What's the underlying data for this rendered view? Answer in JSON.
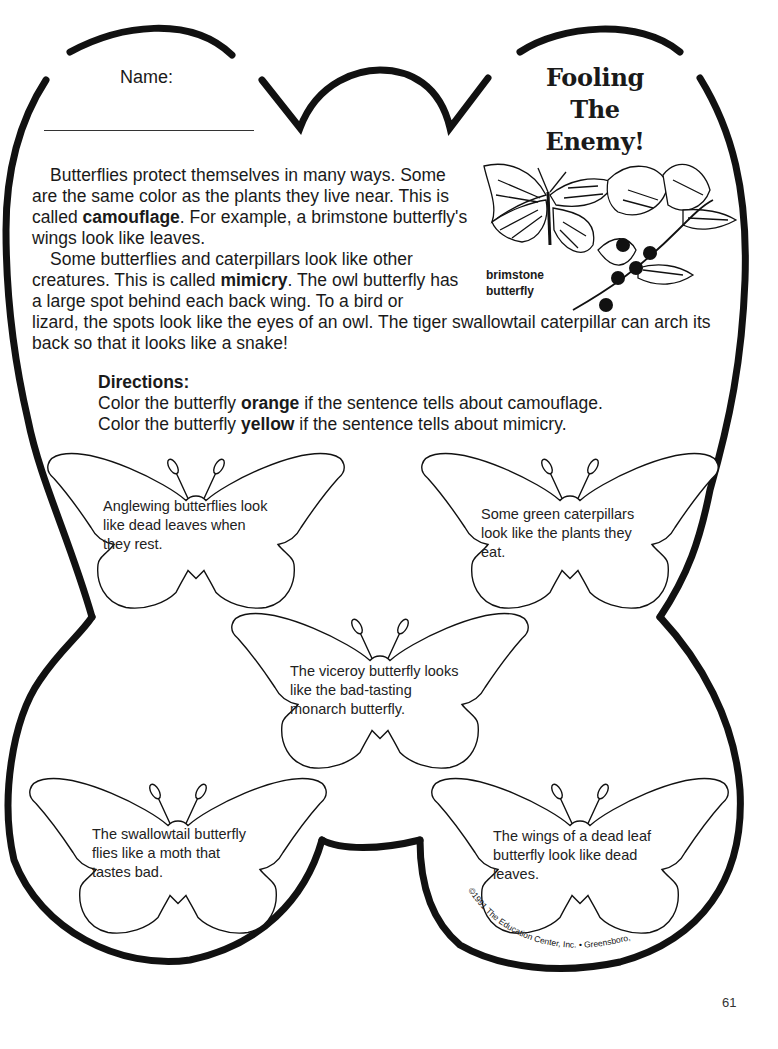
{
  "worksheet": {
    "name_label": "Name:",
    "title_lines": [
      "Fooling",
      "The",
      "Enemy!"
    ],
    "illustration": {
      "caption_lines": [
        "brimstone",
        "butterfly"
      ],
      "icon": "brimstone-butterfly-on-leaves-illustration"
    },
    "intro": {
      "para1": {
        "pre": "Butterflies protect themselves in many ways. Some are the same color as the plants they live near. This is called ",
        "bold": "camouflage",
        "post": ". For example, a brimstone butterfly's wings look like leaves."
      },
      "para2": {
        "pre": "Some butterflies and caterpillars look like other creatures. This is called ",
        "bold": "mimicry",
        "post": ". The owl butterfly has a large spot behind each back wing. To a bird or"
      },
      "para2_cont": "lizard, the spots look like the eyes of an owl. The tiger swallowtail caterpillar can arch its back so that it looks like a snake!"
    },
    "directions": {
      "title": "Directions:",
      "line1": {
        "pre": "Color the butterfly ",
        "bold": "orange",
        "post": " if the sentence tells about camouflage."
      },
      "line2": {
        "pre": "Color the butterfly ",
        "bold": "yellow",
        "post": " if the sentence tells about mimicry."
      }
    },
    "butterflies": [
      {
        "lines": [
          "Anglewing butterflies look",
          "like dead leaves when",
          "they rest."
        ]
      },
      {
        "lines": [
          "Some green caterpillars",
          "look like the plants they",
          "eat."
        ]
      },
      {
        "lines": [
          "The viceroy butterfly looks",
          "like the bad-tasting",
          "monarch butterfly."
        ]
      },
      {
        "lines": [
          "The swallowtail butterfly",
          "flies like a moth that",
          "tastes bad."
        ]
      },
      {
        "lines": [
          "The wings of a dead leaf",
          "butterfly look like dead",
          "leaves."
        ]
      }
    ],
    "copyright": "©1991 The Education Center, Inc. • Greensboro, NC",
    "page_number": "61"
  }
}
